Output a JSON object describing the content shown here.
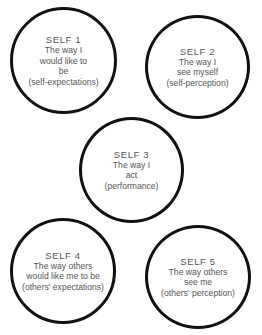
{
  "diagram": {
    "circles": [
      {
        "id": "self-1",
        "title": "SELF 1",
        "lines": [
          "The way I",
          "would like to",
          "be",
          "(self-expectations)"
        ]
      },
      {
        "id": "self-2",
        "title": "SELF 2",
        "lines": [
          "The way I",
          "see myself",
          "(self-perception)"
        ]
      },
      {
        "id": "self-3",
        "title": "SELF 3",
        "lines": [
          "The way I",
          "act",
          "(performance)"
        ]
      },
      {
        "id": "self-4",
        "title": "SELF 4",
        "lines": [
          "The way others",
          "would like me to be",
          "(others' expectations)"
        ]
      },
      {
        "id": "self-5",
        "title": "SELF 5",
        "lines": [
          "The way others",
          "see me",
          "(others' perception)"
        ]
      }
    ],
    "colors": {
      "stroke": "#111111",
      "text": "#555555",
      "background": "#ffffff"
    }
  }
}
